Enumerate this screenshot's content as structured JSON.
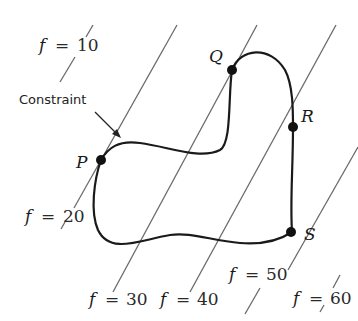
{
  "figure": {
    "type": "level-curves-with-constraint",
    "constraint_label": "Constraint",
    "points": [
      {
        "name": "P",
        "label": "P"
      },
      {
        "name": "Q",
        "label": "Q"
      },
      {
        "name": "R",
        "label": "R"
      },
      {
        "name": "S",
        "label": "S"
      }
    ],
    "level_curves": [
      {
        "f": "f",
        "eq": "=",
        "value": "10"
      },
      {
        "f": "f",
        "eq": "=",
        "value": "20"
      },
      {
        "f": "f",
        "eq": "=",
        "value": "30"
      },
      {
        "f": "f",
        "eq": "=",
        "value": "40"
      },
      {
        "f": "f",
        "eq": "=",
        "value": "50"
      },
      {
        "f": "f",
        "eq": "=",
        "value": "60"
      }
    ],
    "colors": {
      "level_line": "#6a6a6a",
      "constraint_curve": "#1a1a1a",
      "background": "#ffffff"
    }
  }
}
